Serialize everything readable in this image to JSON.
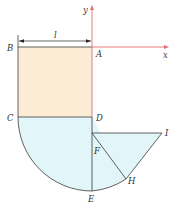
{
  "diagram": {
    "type": "geometry-figure",
    "colors": {
      "rect_fill": "#fcecd6",
      "semicircle_fill": "#e2f5f9",
      "outline": "#3a3a3a",
      "axis": "#e07070",
      "dimension": "#222222"
    },
    "axes": {
      "x_label": "x",
      "y_label": "y"
    },
    "dimension": {
      "label": "l"
    },
    "points": {
      "A": "A",
      "B": "B",
      "C": "C",
      "D": "D",
      "E": "E",
      "F": "F",
      "H": "H",
      "I": "I"
    }
  }
}
